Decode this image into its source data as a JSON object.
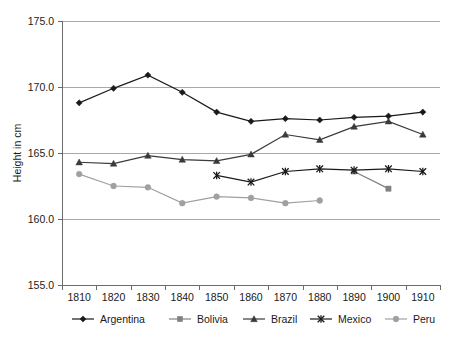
{
  "chart_data": {
    "type": "line",
    "title": "",
    "xlabel": "",
    "ylabel": "Height in cm",
    "x": [
      1810,
      1820,
      1830,
      1840,
      1850,
      1860,
      1870,
      1880,
      1890,
      1900,
      1910
    ],
    "xtick_labels": [
      "1810",
      "1820",
      "1830",
      "1840",
      "1850",
      "1860",
      "1870",
      "1880",
      "1890",
      "1900",
      "1910"
    ],
    "ytick_labels": [
      "175.0",
      "170.0",
      "165.0",
      "160.0",
      "155.0"
    ],
    "yticks": [
      175.0,
      170.0,
      165.0,
      160.0,
      155.0
    ],
    "ylim": [
      155.0,
      175.0
    ],
    "xlim": [
      1805,
      1915
    ],
    "grid": true,
    "legend_position": "bottom",
    "series": [
      {
        "name": "Argentina",
        "marker": "diamond",
        "color": "#1a1a1a",
        "x": [
          1810,
          1820,
          1830,
          1840,
          1850,
          1860,
          1870,
          1880,
          1890,
          1900,
          1910
        ],
        "values": [
          168.8,
          169.9,
          170.9,
          169.6,
          168.1,
          167.4,
          167.6,
          167.5,
          167.7,
          167.8,
          168.1
        ]
      },
      {
        "name": "Bolivia",
        "marker": "square",
        "color": "#808080",
        "x": [
          1890,
          1900
        ],
        "values": [
          163.6,
          162.3
        ]
      },
      {
        "name": "Brazil",
        "marker": "triangle",
        "color": "#3a3a3a",
        "x": [
          1810,
          1820,
          1830,
          1840,
          1850,
          1860,
          1870,
          1880,
          1890,
          1900,
          1910
        ],
        "values": [
          164.3,
          164.2,
          164.8,
          164.5,
          164.4,
          164.9,
          166.4,
          166.0,
          167.0,
          167.4,
          166.4
        ]
      },
      {
        "name": "Mexico",
        "marker": "star",
        "color": "#1a1a1a",
        "x": [
          1850,
          1860,
          1870,
          1880,
          1890,
          1900,
          1910
        ],
        "values": [
          163.3,
          162.8,
          163.6,
          163.8,
          163.7,
          163.8,
          163.6
        ]
      },
      {
        "name": "Peru",
        "marker": "circle",
        "color": "#a0a0a0",
        "x": [
          1810,
          1820,
          1830,
          1840,
          1850,
          1860,
          1870,
          1880
        ],
        "values": [
          163.4,
          162.5,
          162.4,
          161.2,
          161.7,
          161.6,
          161.2,
          161.4
        ]
      }
    ],
    "legend": [
      {
        "label": "Argentina",
        "marker": "diamond",
        "color": "#1a1a1a"
      },
      {
        "label": "Bolivia",
        "marker": "square",
        "color": "#808080"
      },
      {
        "label": "Brazil",
        "marker": "triangle",
        "color": "#3a3a3a"
      },
      {
        "label": "Mexico",
        "marker": "star",
        "color": "#1a1a1a"
      },
      {
        "label": "Peru",
        "marker": "circle",
        "color": "#a0a0a0"
      }
    ],
    "colors": {
      "gridline": "#a8a8a8",
      "axis": "#6b6b6b",
      "text": "#1a1a1a",
      "background": "#ffffff"
    }
  }
}
